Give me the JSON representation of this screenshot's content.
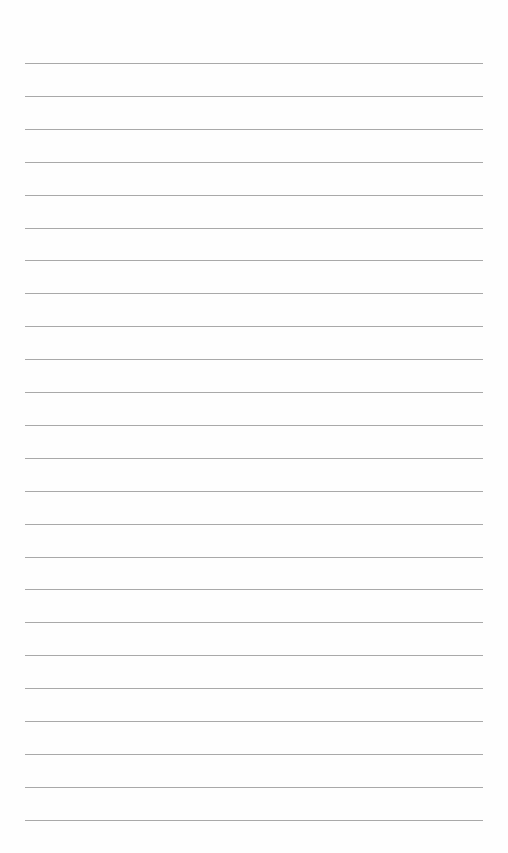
{
  "page": {
    "type": "ruled-paper",
    "background_color": "#fefefe",
    "rule_color": "#9a9a9a",
    "rule_count": 24,
    "first_rule_y": 63,
    "rule_spacing": 32.9,
    "rule_left": 25,
    "rule_right": 483,
    "lines": [
      {
        "text": ""
      },
      {
        "text": ""
      },
      {
        "text": ""
      },
      {
        "text": ""
      },
      {
        "text": ""
      },
      {
        "text": ""
      },
      {
        "text": ""
      },
      {
        "text": ""
      },
      {
        "text": ""
      },
      {
        "text": ""
      },
      {
        "text": ""
      },
      {
        "text": ""
      },
      {
        "text": ""
      },
      {
        "text": ""
      },
      {
        "text": ""
      },
      {
        "text": ""
      },
      {
        "text": ""
      },
      {
        "text": ""
      },
      {
        "text": ""
      },
      {
        "text": ""
      },
      {
        "text": ""
      },
      {
        "text": ""
      },
      {
        "text": ""
      },
      {
        "text": ""
      }
    ]
  }
}
